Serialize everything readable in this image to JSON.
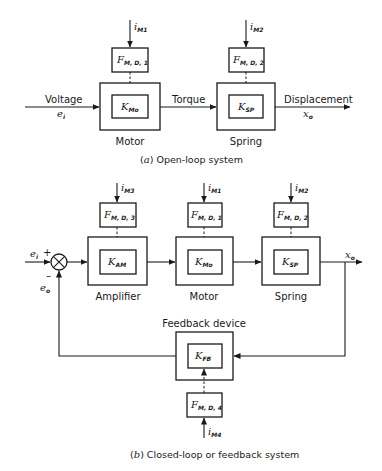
{
  "open_loop": {
    "caption_letter": "a",
    "caption_text": "Open-loop system",
    "input_label": "Voltage",
    "input_symbol": "e",
    "input_sub": "i",
    "link_label": "Torque",
    "output_label": "Displacement",
    "output_symbol": "x",
    "output_sub": "o",
    "blocks": [
      {
        "name": "Motor",
        "gain_symbol": "K",
        "gain_sub": "Mo",
        "mod_symbol": "F",
        "mod_sub": "M, D, 1",
        "input_symbol": "i",
        "input_sub": "M1"
      },
      {
        "name": "Spring",
        "gain_symbol": "K",
        "gain_sub": "SP",
        "mod_symbol": "F",
        "mod_sub": "M, D, 2",
        "input_symbol": "i",
        "input_sub": "M2"
      }
    ]
  },
  "closed_loop": {
    "caption_letter": "b",
    "caption_text": "Closed-loop or feedback system",
    "input_symbol": "e",
    "input_sub": "i",
    "feedback_symbol": "e",
    "feedback_sub": "o",
    "plus_sign": "+",
    "minus_sign": "–",
    "output_symbol": "x",
    "output_sub": "o",
    "blocks": [
      {
        "name": "Amplifier",
        "gain_symbol": "K",
        "gain_sub": "AM",
        "mod_symbol": "F",
        "mod_sub": "M, D, 3",
        "input_symbol": "i",
        "input_sub": "M3"
      },
      {
        "name": "Motor",
        "gain_symbol": "K",
        "gain_sub": "Mo",
        "mod_symbol": "F",
        "mod_sub": "M, D, 1",
        "input_symbol": "i",
        "input_sub": "M1"
      },
      {
        "name": "Spring",
        "gain_symbol": "K",
        "gain_sub": "SP",
        "mod_symbol": "F",
        "mod_sub": "M, D, 2",
        "input_symbol": "i",
        "input_sub": "M2"
      }
    ],
    "feedback_block": {
      "name": "Feedback device",
      "gain_symbol": "K",
      "gain_sub": "FB",
      "mod_symbol": "F",
      "mod_sub": "M, D, 4",
      "input_symbol": "i",
      "input_sub": "M4"
    }
  }
}
